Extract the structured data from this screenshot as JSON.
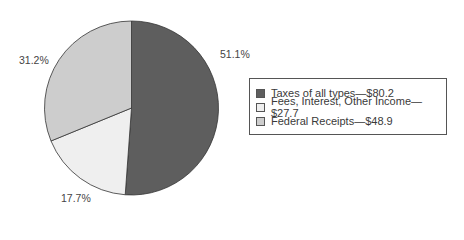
{
  "chart_data": {
    "type": "pie",
    "title": "",
    "categories": [
      "Taxes of all types",
      "Fees, Interest, Other Income",
      "Federal Receipts"
    ],
    "values": [
      80.2,
      27.7,
      48.9
    ],
    "percentages": [
      51.1,
      17.7,
      31.2
    ],
    "percent_labels": [
      "51.1%",
      "17.7%",
      "31.2%"
    ],
    "colors": [
      "#5e5e5e",
      "#efefef",
      "#cdcdcd"
    ],
    "legend": {
      "position": "right",
      "entries": [
        "Taxes of all types—$80.2",
        "Fees, Interest, Other Income—$27.7",
        "Federal Receipts—$48.9"
      ]
    },
    "start_angle_deg": 0,
    "direction": "clockwise"
  }
}
